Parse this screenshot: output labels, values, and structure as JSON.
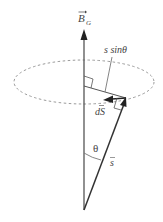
{
  "diagram": {
    "labels": {
      "field": "B",
      "field_subscript": "G",
      "perp_distance": "s sinθ",
      "line_element": "dS",
      "angle": "θ",
      "position_vector": "s"
    },
    "colors": {
      "axis": "#555555",
      "vector": "#333333",
      "ellipse": "#9a9a9a",
      "text": "#444444",
      "background": "#ffffff"
    },
    "geometry": {
      "origin": [
        84,
        210
      ],
      "axis_tip": [
        84,
        28
      ],
      "ellipse_center": [
        84,
        82
      ],
      "ellipse_rx": 70,
      "ellipse_ry": 22,
      "vector_tip": [
        126,
        98
      ],
      "dS_tip": [
        104,
        99
      ]
    }
  }
}
